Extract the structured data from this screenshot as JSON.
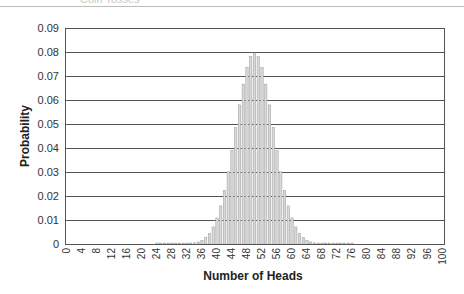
{
  "header": {
    "cut_title": "Coin Tosses"
  },
  "chart_data": {
    "type": "bar",
    "title": "",
    "xlabel": "Number of Heads",
    "ylabel": "Probability",
    "ylim": [
      0,
      0.09
    ],
    "xlim": [
      0,
      100
    ],
    "grid": true,
    "legend": "none",
    "y_ticks": [
      "0",
      "0.01",
      "0.02",
      "0.03",
      "0.04",
      "0.05",
      "0.06",
      "0.07",
      "0.08",
      "0.09"
    ],
    "x_ticks": [
      "0",
      "4",
      "8",
      "12",
      "16",
      "20",
      "24",
      "28",
      "32",
      "36",
      "40",
      "44",
      "48",
      "52",
      "56",
      "60",
      "64",
      "68",
      "72",
      "76",
      "80",
      "84",
      "88",
      "92",
      "96",
      "100"
    ],
    "categories": [
      24,
      25,
      26,
      27,
      28,
      29,
      30,
      31,
      32,
      33,
      34,
      35,
      36,
      37,
      38,
      39,
      40,
      41,
      42,
      43,
      44,
      45,
      46,
      47,
      48,
      49,
      50,
      51,
      52,
      53,
      54,
      55,
      56,
      57,
      58,
      59,
      60,
      61,
      62,
      63,
      64,
      65,
      66,
      67,
      68,
      69,
      70,
      71,
      72,
      73,
      74,
      75,
      76
    ],
    "values": [
      0.0004,
      0.0004,
      0.0004,
      0.0004,
      0.0004,
      0.0004,
      0.0004,
      0.0004,
      0.0004,
      0.0004,
      0.00046,
      0.00086,
      0.00156,
      0.00271,
      0.00448,
      0.00711,
      0.01084,
      0.01587,
      0.02229,
      0.03007,
      0.03895,
      0.04847,
      0.05796,
      0.06659,
      0.07353,
      0.07803,
      0.07959,
      0.07803,
      0.07353,
      0.06659,
      0.05796,
      0.04847,
      0.03895,
      0.03007,
      0.02229,
      0.01587,
      0.01084,
      0.00711,
      0.00448,
      0.00271,
      0.00156,
      0.00086,
      0.00046,
      0.0004,
      0.0004,
      0.0004,
      0.0004,
      0.0004,
      0.0004,
      0.0004,
      0.0004,
      0.0004,
      0.0004
    ],
    "colors": {
      "bar_fill": "#d9d9d9",
      "bar_stroke": "#9a9a9a",
      "grid": "#555555",
      "axis": "#555555"
    }
  }
}
